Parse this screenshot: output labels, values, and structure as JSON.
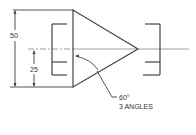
{
  "drawing": {
    "title": "Triangle with 60 degree angles between brackets",
    "dimensions": {
      "overall_height": "50",
      "half_height": "25"
    },
    "angle_note": {
      "angle": "60°",
      "note": "3 ANGLES"
    },
    "colors": {
      "line": "#555555",
      "text": "#333333",
      "background": "#ffffff"
    }
  }
}
